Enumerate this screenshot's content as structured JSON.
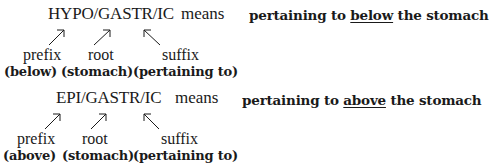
{
  "blocks": [
    {
      "term": "HYPO/GASTR/IC",
      "means_label": "means",
      "parts": [
        {
          "label": "prefix",
          "gloss": "(below)"
        },
        {
          "label": "root",
          "gloss": "(stomach)"
        },
        {
          "label": "suffix",
          "gloss": "(pertaining to)"
        }
      ],
      "meaning": {
        "before": "pertaining to ",
        "emphasis": "below",
        "after": " the stomach"
      }
    },
    {
      "term": "EPI/GASTR/IC",
      "means_label": "means",
      "parts": [
        {
          "label": "prefix",
          "gloss": "(above)"
        },
        {
          "label": "root",
          "gloss": "(stomach)"
        },
        {
          "label": "suffix",
          "gloss": "(pertaining to)"
        }
      ],
      "meaning": {
        "before": "pertaining to ",
        "emphasis": "above",
        "after": " the stomach"
      }
    }
  ]
}
